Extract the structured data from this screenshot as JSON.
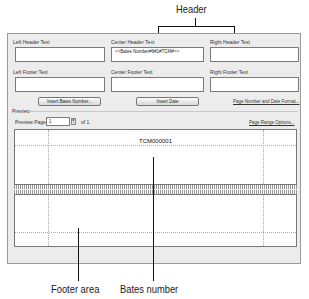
{
  "callouts": {
    "header": "Header",
    "footer_area": "Footer area",
    "bates_number": "Bates number"
  },
  "dialog": {
    "fields": {
      "left_header_label": "Left Header Text",
      "center_header_label": "Center Header Text",
      "right_header_label": "Right Header Text",
      "left_footer_label": "Left Footer Text",
      "center_footer_label": "Center Footer Text",
      "right_footer_label": "Right Footer Text",
      "left_header_value": "",
      "center_header_value": "<<Bates Number#6#1#TCM#>>",
      "right_header_value": "",
      "left_footer_value": "",
      "center_footer_value": "",
      "right_footer_value": ""
    },
    "buttons": {
      "insert_bates": "Insert Bates Number...",
      "insert_date": "Insert Date",
      "page_number_format": "Page Number and Date Format..."
    },
    "preview": {
      "section_label": "Preview",
      "page_label": "Preview Page",
      "page_value": "1",
      "page_of": "of 1",
      "page_range_options": "Page Range Options...",
      "bates_text": "TCM000001"
    }
  }
}
